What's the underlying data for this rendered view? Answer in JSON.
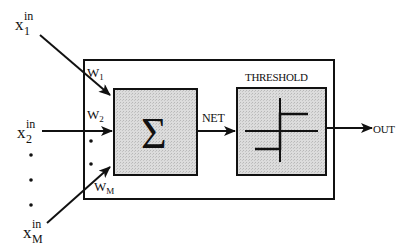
{
  "diagram": {
    "type": "perceptron-neuron",
    "inputs": [
      {
        "base": "x",
        "sup": "in",
        "sub": "1"
      },
      {
        "base": "x",
        "sup": "in",
        "sub": "2"
      },
      {
        "base": "x",
        "sup": "in",
        "sub": "M"
      }
    ],
    "weights": [
      {
        "base": "W",
        "sub": "1"
      },
      {
        "base": "W",
        "sub": "2"
      },
      {
        "base": "W",
        "sub": "M"
      }
    ],
    "summation": {
      "symbol": "Σ"
    },
    "net_label": "NET",
    "threshold_label": "THRESHOLD",
    "output_label": "OUT",
    "colors": {
      "stroke": "#111111",
      "block_fill": "#d4d4d4",
      "background": "#ffffff"
    }
  }
}
